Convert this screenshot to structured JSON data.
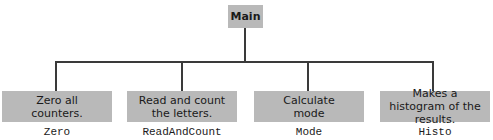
{
  "diagram": {
    "type": "hierarchy-chart",
    "root": {
      "label": "Main"
    },
    "children": [
      {
        "description": "Zero all counters.",
        "name": "Zero"
      },
      {
        "description": "Read and count the letters.",
        "name": "ReadAndCount"
      },
      {
        "description": "Calculate mode",
        "name": "Mode"
      },
      {
        "description": "Makes a histogram of the results.",
        "name": "Histo"
      }
    ],
    "colors": {
      "box_fill": "#b9b9b9",
      "line": "#3a3a3a",
      "text": "#1a1a1a",
      "background": "#ffffff"
    }
  }
}
